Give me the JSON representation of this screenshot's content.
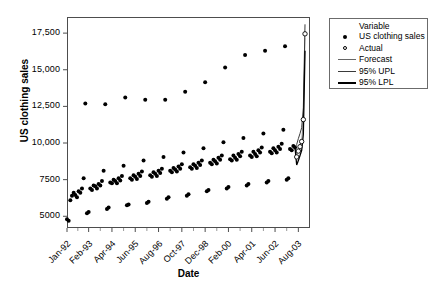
{
  "axes": {
    "ylabel": "US clothing sales",
    "xlabel": "Date",
    "yticks": [
      "5000",
      "7500",
      "10,000",
      "12,500",
      "15,000",
      "17,500"
    ],
    "ytick_values": [
      5000,
      7500,
      10000,
      12500,
      15000,
      17500
    ],
    "xticks": [
      "Jan-92",
      "Feb-93",
      "Apr-94",
      "Jun-95",
      "Aug-96",
      "Oct-97",
      "Dec-98",
      "Feb-00",
      "Apr-01",
      "Jun-02",
      "Aug-03"
    ]
  },
  "legend": {
    "title": "Variable",
    "items": [
      {
        "label": "US clothing sales",
        "marker": "filled-circle",
        "color": "#000000"
      },
      {
        "label": "Actual",
        "marker": "open-circle",
        "color": "#000000"
      },
      {
        "label": "Forecast",
        "marker": "line-thin",
        "color": "#666666"
      },
      {
        "label": "95% UPL",
        "marker": "line-medium",
        "color": "#3a3a3a"
      },
      {
        "label": "95% LPL",
        "marker": "line-thick",
        "color": "#000000"
      }
    ]
  },
  "chart_data": {
    "type": "scatter",
    "title": "",
    "xlabel": "Date",
    "ylabel": "US clothing sales",
    "xlim": [
      0,
      146
    ],
    "ylim": [
      4200,
      18600
    ],
    "grid": false,
    "legend_position": "right",
    "x_tick_indices": [
      0,
      13,
      27,
      41,
      55,
      69,
      83,
      97,
      111,
      125,
      139
    ],
    "series": [
      {
        "name": "US clothing sales",
        "marker": "filled-circle",
        "x": [
          0,
          1,
          2,
          3,
          4,
          5,
          6,
          7,
          8,
          9,
          10,
          11,
          12,
          13,
          14,
          15,
          16,
          17,
          18,
          19,
          20,
          21,
          22,
          23,
          24,
          25,
          26,
          27,
          28,
          29,
          30,
          31,
          32,
          33,
          34,
          35,
          36,
          37,
          38,
          39,
          40,
          41,
          42,
          43,
          44,
          45,
          46,
          47,
          48,
          49,
          50,
          51,
          52,
          53,
          54,
          55,
          56,
          57,
          58,
          59,
          60,
          61,
          62,
          63,
          64,
          65,
          66,
          67,
          68,
          69,
          70,
          71,
          72,
          73,
          74,
          75,
          76,
          77,
          78,
          79,
          80,
          81,
          82,
          83,
          84,
          85,
          86,
          87,
          88,
          89,
          90,
          91,
          92,
          93,
          94,
          95,
          96,
          97,
          98,
          99,
          100,
          101,
          102,
          103,
          104,
          105,
          106,
          107,
          108,
          109,
          110,
          111,
          112,
          113,
          114,
          115,
          116,
          117,
          118,
          119,
          120,
          121,
          122,
          123,
          124,
          125,
          126,
          127,
          128,
          129,
          130,
          131,
          132,
          133,
          134,
          135,
          136,
          137
        ],
        "y": [
          4800,
          4700,
          6100,
          6400,
          6600,
          6450,
          6300,
          6700,
          6600,
          6900,
          7600,
          12700,
          5200,
          5300,
          6900,
          6800,
          7100,
          7050,
          6900,
          7200,
          7100,
          7400,
          8100,
          12650,
          5500,
          5600,
          7300,
          7250,
          7500,
          7400,
          7250,
          7600,
          7450,
          7750,
          8450,
          13100,
          5750,
          5800,
          7600,
          7500,
          7800,
          7700,
          7550,
          7900,
          7750,
          8050,
          8800,
          12950,
          5900,
          6000,
          7800,
          7700,
          8000,
          7900,
          7750,
          8100,
          7950,
          8250,
          9050,
          12950,
          6200,
          6300,
          8100,
          8000,
          8300,
          8200,
          8050,
          8400,
          8250,
          8550,
          9350,
          13500,
          6400,
          6500,
          8350,
          8250,
          8550,
          8450,
          8300,
          8650,
          8500,
          8800,
          9650,
          14150,
          6700,
          6800,
          8650,
          8550,
          8850,
          8750,
          8600,
          9000,
          8850,
          9150,
          10050,
          15150,
          6900,
          7000,
          8900,
          8800,
          9150,
          9000,
          8850,
          9250,
          9100,
          9400,
          10350,
          16000,
          7100,
          7200,
          9150,
          9050,
          9400,
          9250,
          9100,
          9500,
          9350,
          9700,
          10650,
          16300,
          7300,
          7400,
          9400,
          9300,
          9650,
          9500,
          9350,
          9750,
          9600,
          9950,
          10900,
          16600,
          7500,
          7600,
          9600,
          9500,
          9800,
          9700
        ]
      },
      {
        "name": "Actual",
        "marker": "open-circle",
        "x": [
          138,
          139,
          140,
          141,
          142,
          143
        ],
        "y": [
          9050,
          9450,
          9750,
          10100,
          11600,
          17450
        ]
      },
      {
        "name": "Forecast",
        "marker": "line-thin",
        "x": [
          137,
          138,
          139,
          140,
          141,
          142,
          143
        ],
        "y": [
          9700,
          9200,
          9550,
          9900,
          10250,
          11500,
          17200
        ]
      },
      {
        "name": "95% UPL",
        "marker": "line-medium",
        "x": [
          137,
          138,
          139,
          140,
          141,
          142,
          143
        ],
        "y": [
          9700,
          9900,
          10300,
          10650,
          11050,
          12400,
          18100
        ]
      },
      {
        "name": "95% LPL",
        "marker": "line-thick",
        "x": [
          137,
          138,
          139,
          140,
          141,
          142,
          143
        ],
        "y": [
          9700,
          8500,
          8800,
          9150,
          9500,
          10600,
          16300
        ]
      }
    ]
  }
}
